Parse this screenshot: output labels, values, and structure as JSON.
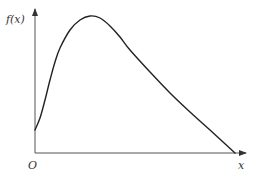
{
  "chart_data": {
    "type": "line",
    "title": "",
    "xlabel": "x",
    "ylabel": "f(x)",
    "origin_label": "O",
    "grid": false,
    "legend": null,
    "series": [
      {
        "name": "f(x)",
        "points_pixel_approx": [
          [
            35,
            130
          ],
          [
            40,
            118
          ],
          [
            45,
            100
          ],
          [
            50,
            80
          ],
          [
            55,
            62
          ],
          [
            60,
            48
          ],
          [
            70,
            30
          ],
          [
            80,
            20
          ],
          [
            90,
            16
          ],
          [
            100,
            18
          ],
          [
            110,
            26
          ],
          [
            120,
            37
          ],
          [
            130,
            50
          ],
          [
            150,
            72
          ],
          [
            170,
            93
          ],
          [
            190,
            112
          ],
          [
            210,
            130
          ],
          [
            235,
            153
          ]
        ]
      }
    ],
    "axes": {
      "x_axis": {
        "from": [
          35,
          153
        ],
        "to": [
          245,
          153
        ],
        "arrow": true
      },
      "y_axis": {
        "from": [
          35,
          153
        ],
        "to": [
          35,
          8
        ],
        "arrow": true
      }
    }
  },
  "labels": {
    "y": "f(x)",
    "x": "x",
    "origin": "O"
  },
  "colors": {
    "axis": "#555555",
    "curve": "#222222",
    "text": "#333333"
  }
}
